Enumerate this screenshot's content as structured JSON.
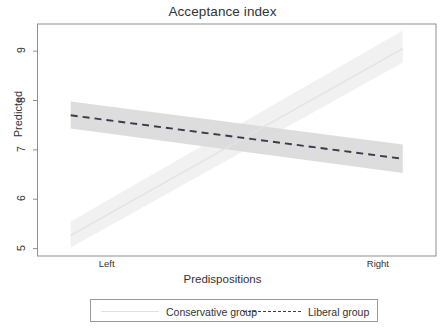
{
  "chart_data": {
    "type": "line",
    "title": "Acceptance index",
    "xlabel": "Predispositions",
    "ylabel": "Predicted",
    "grid": false,
    "legend_position": "bottom",
    "x": [
      0,
      1
    ],
    "xtick_labels": [
      "Left",
      "Right"
    ],
    "xtick_values": [
      0,
      1
    ],
    "ytick_labels": [
      "5",
      "6",
      "7",
      "8",
      "9"
    ],
    "ytick_values": [
      5,
      6,
      7,
      8,
      9
    ],
    "ylim": [
      4.85,
      9.55
    ],
    "xlim": [
      -0.1,
      1.1
    ],
    "series": [
      {
        "name": "Conservative group",
        "style": "solid",
        "color": "#e3e3e3",
        "band_color": "#efefef",
        "values": [
          5.27,
          9.05
        ],
        "ci_lower": [
          5.02,
          8.77
        ],
        "ci_upper": [
          5.55,
          9.42
        ]
      },
      {
        "name": "Liberal group",
        "style": "dashed",
        "color": "#3a3a4a",
        "band_color": "#d9d9d9",
        "values": [
          7.7,
          6.82
        ],
        "ci_lower": [
          7.43,
          6.53
        ],
        "ci_upper": [
          7.98,
          7.11
        ]
      }
    ],
    "crossing_point": {
      "x": 0.555,
      "y": 7.25
    }
  },
  "legend": {
    "items": [
      {
        "label": "Conservative group",
        "key": "solid-line-key"
      },
      {
        "label": "Liberal group",
        "key": "dashed-line-key"
      }
    ]
  }
}
